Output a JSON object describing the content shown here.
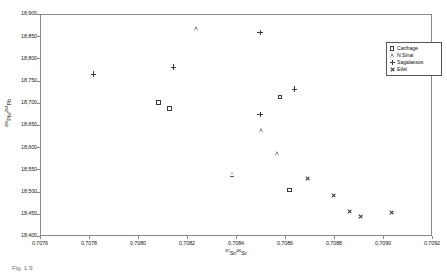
{
  "chart_data": {
    "type": "scatter",
    "title": "",
    "xlabel": "87Sr/86Sr",
    "ylabel": "206Pb/204Pb",
    "xlabel_parts": {
      "sup1": "87",
      "base1": "Sr/",
      "sup2": "86",
      "base2": "Sr"
    },
    "ylabel_parts": {
      "sup1": "206",
      "base1": "Pb/",
      "sup2": "204",
      "base2": "Pb"
    },
    "xlim": [
      0.7076,
      0.7092
    ],
    "ylim": [
      18400,
      18900
    ],
    "xticks": [
      0.7076,
      0.7078,
      0.708,
      0.7082,
      0.7084,
      0.7086,
      0.7088,
      0.709,
      0.7092
    ],
    "xtick_labels": [
      "0,7076",
      "0,7078",
      "0,7080",
      "0,7082",
      "0,7084",
      "0,7086",
      "0,7088",
      "0,7090",
      "0,7092"
    ],
    "yticks": [
      18400,
      18450,
      18500,
      18550,
      18600,
      18650,
      18700,
      18750,
      18800,
      18850,
      18900
    ],
    "ytick_labels": [
      "18,400",
      "18,450",
      "18,500",
      "18,550",
      "18,600",
      "18,650",
      "18,700",
      "18,750",
      "18,800",
      "18,850",
      "18,900"
    ],
    "grid": false,
    "legend_position": "top-right",
    "series": [
      {
        "name": "Carthage",
        "marker": "open-square",
        "points": [
          {
            "x": 0.70808,
            "y": 18703
          },
          {
            "x": 0.708125,
            "y": 18689
          },
          {
            "x": 0.708575,
            "y": 18715
          },
          {
            "x": 0.708615,
            "y": 18506
          }
        ]
      },
      {
        "name": "N Sinai",
        "marker": "open-triangle",
        "points": [
          {
            "x": 0.708235,
            "y": 18869
          },
          {
            "x": 0.7085,
            "y": 18639
          },
          {
            "x": 0.708565,
            "y": 18587
          },
          {
            "x": 0.708385,
            "y": 18541
          }
        ]
      },
      {
        "name": "Sagalassos",
        "marker": "plus",
        "points": [
          {
            "x": 0.707815,
            "y": 18767
          },
          {
            "x": 0.70814,
            "y": 18783
          },
          {
            "x": 0.708495,
            "y": 18861
          },
          {
            "x": 0.708495,
            "y": 18676
          },
          {
            "x": 0.708635,
            "y": 18733
          }
        ]
      },
      {
        "name": "Eifel",
        "marker": "x",
        "points": [
          {
            "x": 0.70869,
            "y": 18532
          },
          {
            "x": 0.708795,
            "y": 18494
          },
          {
            "x": 0.70886,
            "y": 18458
          },
          {
            "x": 0.708905,
            "y": 18446
          },
          {
            "x": 0.70903,
            "y": 18455
          }
        ]
      }
    ]
  },
  "legend": {
    "items": [
      {
        "label": "Carthage",
        "marker": "open-square"
      },
      {
        "label": "N Sinai",
        "marker": "open-triangle"
      },
      {
        "label": "Sagalassos",
        "marker": "plus"
      },
      {
        "label": "Eifel",
        "marker": "x"
      }
    ]
  },
  "caption": {
    "text": "Fig. 1 S"
  }
}
